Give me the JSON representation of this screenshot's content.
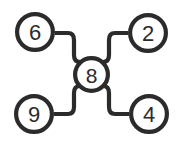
{
  "diagram": {
    "type": "node-link-graph",
    "title": "",
    "background_color": "#ffffff",
    "stroke_color": "#2b2b2b",
    "node_fill_color": "#ffffff",
    "stroke_width": 4.2,
    "center_node": {
      "id": "center",
      "label": "8",
      "cx": 91.5,
      "cy": 74.5,
      "r": 18.5
    },
    "outer_nodes": [
      {
        "id": "top-left",
        "label": "6",
        "cx": 35,
        "cy": 32,
        "r": 20
      },
      {
        "id": "top-right",
        "label": "2",
        "cx": 148,
        "cy": 33,
        "r": 20
      },
      {
        "id": "bottom-left",
        "label": "9",
        "cx": 34,
        "cy": 114,
        "r": 20
      },
      {
        "id": "bottom-right",
        "label": "4",
        "cx": 149,
        "cy": 114,
        "r": 20
      }
    ],
    "edges": [
      {
        "id": "edge-6-8",
        "from": "top-left",
        "to": "center",
        "path": "M 55 33 H 68 Q 74 33 74 40 V 55 Q 74 62 80 62 H 83"
      },
      {
        "id": "edge-2-8",
        "from": "top-right",
        "to": "center",
        "path": "M 128 33 H 115 Q 109 33 109 40 V 55 Q 109 62 103 62 H 100"
      },
      {
        "id": "edge-9-8",
        "from": "bottom-left",
        "to": "center",
        "path": "M 54 114 H 68 Q 74 114 74 107 V 93 Q 74 86 80 86 H 83"
      },
      {
        "id": "edge-4-8",
        "from": "bottom-right",
        "to": "center",
        "path": "M 129 114 H 115 Q 109 114 109 107 V 93 Q 109 86 103 86 H 100"
      }
    ]
  }
}
